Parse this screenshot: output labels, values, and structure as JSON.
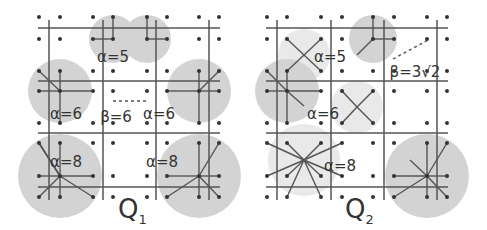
{
  "colors": {
    "background": "#ffffff",
    "disk": "#d3d3d3",
    "line": "#555555",
    "dot": "#333333",
    "text": "#333333"
  },
  "panels": [
    {
      "id": "Q1",
      "label": "Q",
      "subscript": "1",
      "label_pos": [
        118,
        218
      ],
      "dot_xs": [
        39,
        60,
        93,
        113,
        147,
        167,
        199,
        219
      ],
      "dot_ys": [
        17,
        39,
        71,
        91,
        123,
        143,
        176,
        197
      ],
      "vlines": [
        49,
        103,
        156,
        209
      ],
      "hlines": [
        28,
        81,
        133,
        187
      ],
      "span": [
        38,
        220,
        20,
        200
      ],
      "disks": [
        {
          "cx": 113,
          "cy": 39,
          "r": 24
        },
        {
          "cx": 147,
          "cy": 39,
          "r": 24
        },
        {
          "cx": 60,
          "cy": 91,
          "r": 32
        },
        {
          "cx": 199,
          "cy": 91,
          "r": 32
        },
        {
          "cx": 60,
          "cy": 176,
          "r": 42
        },
        {
          "cx": 199,
          "cy": 176,
          "r": 42
        }
      ],
      "segments": [
        [
          113,
          39,
          113,
          17
        ],
        [
          113,
          39,
          93,
          39
        ],
        [
          147,
          39,
          147,
          17
        ],
        [
          147,
          39,
          167,
          39
        ],
        [
          60,
          91,
          39,
          71
        ],
        [
          60,
          91,
          60,
          71
        ],
        [
          60,
          91,
          39,
          91
        ],
        [
          60,
          91,
          93,
          91
        ],
        [
          60,
          91,
          60,
          123
        ],
        [
          199,
          91,
          219,
          71
        ],
        [
          199,
          91,
          199,
          71
        ],
        [
          199,
          91,
          219,
          91
        ],
        [
          199,
          91,
          167,
          91
        ],
        [
          199,
          91,
          199,
          123
        ],
        [
          60,
          176,
          39,
          143
        ],
        [
          60,
          176,
          60,
          143
        ],
        [
          60,
          176,
          39,
          176
        ],
        [
          60,
          176,
          93,
          176
        ],
        [
          60,
          176,
          39,
          197
        ],
        [
          60,
          176,
          60,
          197
        ],
        [
          60,
          176,
          93,
          197
        ],
        [
          60,
          176,
          39,
          143
        ],
        [
          199,
          176,
          219,
          143
        ],
        [
          199,
          176,
          199,
          143
        ],
        [
          199,
          176,
          219,
          176
        ],
        [
          199,
          176,
          167,
          176
        ],
        [
          199,
          176,
          219,
          197
        ],
        [
          199,
          176,
          199,
          197
        ],
        [
          199,
          176,
          167,
          197
        ]
      ],
      "dashed": [
        [
          113,
          101,
          147,
          101
        ]
      ],
      "labels": [
        {
          "text": "α=5",
          "x": 113,
          "y": 57
        },
        {
          "text": "α=6",
          "x": 66,
          "y": 114
        },
        {
          "text": "α=6",
          "x": 159,
          "y": 114
        },
        {
          "text": "β=6",
          "x": 116,
          "y": 117
        },
        {
          "text": "α=8",
          "x": 66,
          "y": 162
        },
        {
          "text": "α=8",
          "x": 162,
          "y": 162
        }
      ]
    },
    {
      "id": "Q2",
      "label": "Q",
      "subscript": "2",
      "label_pos": [
        345,
        218
      ],
      "dot_xs": [
        267,
        287,
        321,
        342,
        373,
        394,
        427,
        447
      ],
      "dot_ys": [
        17,
        39,
        71,
        91,
        123,
        143,
        176,
        197
      ],
      "vlines": [
        277,
        331,
        384,
        437
      ],
      "hlines": [
        28,
        81,
        133,
        187
      ],
      "span": [
        266,
        448,
        20,
        200
      ],
      "disks": [
        {
          "cx": 304,
          "cy": 55,
          "r": 26,
          "light": true
        },
        {
          "cx": 373,
          "cy": 39,
          "r": 24
        },
        {
          "cx": 287,
          "cy": 91,
          "r": 32
        },
        {
          "cx": 357,
          "cy": 107,
          "r": 26,
          "light": true
        },
        {
          "cx": 304,
          "cy": 160,
          "r": 36,
          "light": true
        },
        {
          "cx": 427,
          "cy": 176,
          "r": 42
        }
      ],
      "segments": [
        [
          304,
          55,
          287,
          39
        ],
        [
          304,
          55,
          321,
          39
        ],
        [
          304,
          55,
          287,
          71
        ],
        [
          304,
          55,
          321,
          71
        ],
        [
          373,
          39,
          373,
          17
        ],
        [
          373,
          39,
          394,
          39
        ],
        [
          373,
          39,
          357,
          55
        ],
        [
          287,
          91,
          267,
          71
        ],
        [
          287,
          91,
          287,
          71
        ],
        [
          287,
          91,
          267,
          91
        ],
        [
          287,
          91,
          321,
          91
        ],
        [
          287,
          91,
          287,
          123
        ],
        [
          287,
          91,
          304,
          106
        ],
        [
          357,
          107,
          342,
          91
        ],
        [
          357,
          107,
          373,
          91
        ],
        [
          357,
          107,
          342,
          123
        ],
        [
          357,
          107,
          373,
          123
        ],
        [
          304,
          160,
          267,
          143
        ],
        [
          304,
          160,
          287,
          143
        ],
        [
          304,
          160,
          321,
          143
        ],
        [
          304,
          160,
          342,
          143
        ],
        [
          304,
          160,
          267,
          176
        ],
        [
          304,
          160,
          342,
          176
        ],
        [
          304,
          160,
          287,
          197
        ],
        [
          304,
          160,
          321,
          197
        ],
        [
          304,
          160,
          287,
          176
        ],
        [
          304,
          160,
          321,
          176
        ],
        [
          427,
          176,
          427,
          143
        ],
        [
          427,
          176,
          447,
          143
        ],
        [
          427,
          176,
          394,
          176
        ],
        [
          427,
          176,
          447,
          176
        ],
        [
          427,
          176,
          410,
          160
        ],
        [
          427,
          176,
          394,
          197
        ],
        [
          427,
          176,
          427,
          197
        ],
        [
          427,
          176,
          447,
          197
        ]
      ],
      "dashed": [
        [
          393,
          59,
          430,
          39
        ]
      ],
      "labels": [
        {
          "text": "α=5",
          "x": 330,
          "y": 57
        },
        {
          "text": "β=3√2",
          "x": 415,
          "y": 72
        },
        {
          "text": "α=6",
          "x": 323,
          "y": 114
        },
        {
          "text": "α=8",
          "x": 340,
          "y": 166
        }
      ]
    }
  ]
}
